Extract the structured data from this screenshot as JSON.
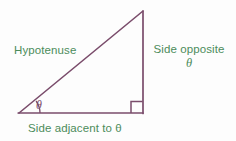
{
  "figure": {
    "name": "right-triangle-trigonometry-diagram",
    "background_color": "#fdfdfd",
    "stroke_color": "#7a4c6b",
    "label_color": "#4c8c5b",
    "angle_label_color": "#7a4c6b"
  },
  "geometry": {
    "vertices": {
      "left": [
        19,
        113
      ],
      "right": [
        143,
        113
      ],
      "apex": [
        143,
        11
      ]
    },
    "right_angle_marker": {
      "x": 131,
      "y": 101,
      "size": 12
    },
    "angle_arc": {
      "center": [
        19,
        113
      ],
      "radius": 21
    },
    "stroke_width": 1.6
  },
  "labels": {
    "hypotenuse": "Hypotenuse",
    "opposite_line1": "Side opposite",
    "opposite_line2": "θ",
    "adjacent": "Side adjacent to θ",
    "angle": "θ"
  }
}
